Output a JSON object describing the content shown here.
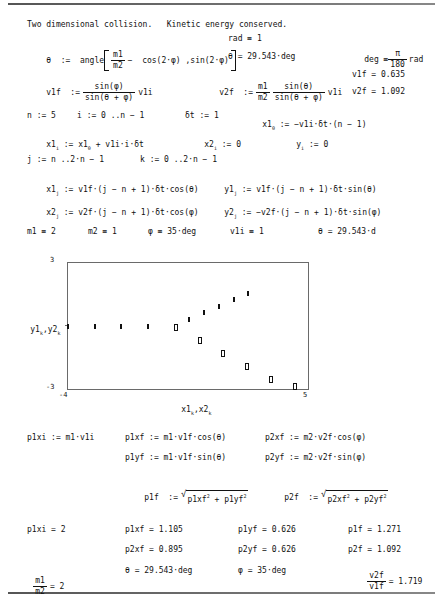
{
  "document": {
    "title_line": "Two dimensional collision.   Kinetic energy conserved.",
    "theta_def_label": "θ  :=  angle",
    "theta_def_m1": "m1",
    "theta_def_m2": "m2",
    "theta_def_rest": "−  cos(2·φ) ,sin(2·φ)",
    "rad_def": "rad ≡ 1",
    "theta_value": "θ = 29.543·deg",
    "deg_def_label": "deg ≡",
    "deg_def_num": "π",
    "deg_def_den": "180",
    "deg_def_unit": "rad",
    "v1f_label": "v1f  :=",
    "v1f_num": "sin(φ)",
    "v1f_den": "sin(θ + φ)",
    "v1f_tail": "v1i",
    "v2f_label": "v2f  :=",
    "v2f_f1_num": "m1",
    "v2f_f1_den": "m2",
    "v2f_f2_num": "sin(θ)",
    "v2f_f2_den": "sin(θ + φ)",
    "v2f_tail": "v1i",
    "v1f_value": "v1f = 0.635",
    "v2f_value": "v2f = 1.092",
    "n_def": "n := 5",
    "i_def": "i := 0 ..n − 1",
    "dt_def": "δt := 1",
    "x1_0_def_head": "x1",
    "x1_0_def_sub": "0",
    "x1_0_def_body": ":= −v1i·δt·(n − 1)",
    "x1_i_head": "x1",
    "x1_i_sub": "i",
    "x1_i_body_a": ":= x1",
    "x1_i_body_sub": "0",
    "x1_i_body_b": "+ v1i·i·δt",
    "x2_i_head": "x2",
    "x2_i_sub": "i",
    "x2_i_body": ":= 0",
    "y_i_head": "y",
    "y_i_sub": "i",
    "y_i_body": ":= 0",
    "j_def": "j := n ..2·n − 1",
    "k_def": "k := 0 ..2·n − 1",
    "x1_j_head": "x1",
    "x1_j_sub": "j",
    "x1_j_body": ":= v1f·(j − n + 1)·δt·cos(θ)",
    "y1_j_head": "y1",
    "y1_j_sub": "j",
    "y1_j_body": ":= v1f·(j − n + 1)·δt·sin(θ)",
    "x2_j_head": "x2",
    "x2_j_sub": "j",
    "x2_j_body": ":= v2f·(j − n + 1)·δt·cos(φ)",
    "y2_j_head": "y2",
    "y2_j_sub": "j",
    "y2_j_body": ":= −v2f·(j − n + 1)·δt·sin(φ)",
    "m1_val": "m1 ≡ 2",
    "m2_val": "m2 ≡ 1",
    "phi_val": "φ ≡ 35·deg",
    "v1i_val": "v1i ≡ 1",
    "theta_val_trunc": "θ = 29.543·d",
    "p1xi_def": "p1xi := m1·v1i",
    "p1xf_def": "p1xf := m1·v1f·cos(θ)",
    "p1yf_def": "p1yf := m1·v1f·sin(θ)",
    "p2xf_def": "p2xf := m2·v2f·cos(φ)",
    "p2yf_def": "p2yf := m2·v2f·sin(φ)",
    "p1f_label": "p1f  :=",
    "p1f_rad_a": "p1xf",
    "p1f_rad_b": "+ p1yf",
    "p2f_label": "p2f  :=",
    "p2f_rad_a": "p2xf",
    "p2f_rad_b": "+ p2yf",
    "sq": "2",
    "p1xi_value": "p1xi = 2",
    "p1xf_value": "p1xf = 1.105",
    "p1yf_value": "p1yf = 0.626",
    "p1f_value": "p1f = 1.271",
    "p2xf_value": "p2xf = 0.895",
    "p2yf_value": "p2yf = 0.626",
    "p2f_value": "p2f = 1.092",
    "ratio_m_num": "m1",
    "ratio_m_den": "m2",
    "ratio_m_value": "= 2",
    "theta_final": "θ = 29.543·deg",
    "phi_final": "φ = 35·deg",
    "ratio_v_num": "v2f",
    "ratio_v_den": "v1f",
    "ratio_v_value": "= 1.719"
  },
  "chart_data": {
    "type": "scatter",
    "title": "",
    "xlabel_parts": {
      "a": "x1",
      "a_sub": "k",
      "b": ",x2",
      "b_sub": "k"
    },
    "ylabel_parts": {
      "a": "y1",
      "a_sub": "k",
      "b": ",y2",
      "b_sub": "k"
    },
    "xlim": [
      -4,
      5
    ],
    "ylim": [
      -3,
      3
    ],
    "xticklabels": [
      "-4",
      "5"
    ],
    "yticklabels": [
      "3",
      "-3"
    ],
    "grid": false,
    "legend": false,
    "series": [
      {
        "name": "y1_k vs x1_k",
        "marker": "filled-diamond",
        "x": [
          -4,
          -3,
          -2,
          -1,
          0,
          0.552,
          1.104,
          1.656,
          2.208,
          2.76
        ],
        "y": [
          0,
          0,
          0,
          0,
          0,
          0.313,
          0.626,
          0.939,
          1.252,
          1.565
        ]
      },
      {
        "name": "y2_k vs x2_k",
        "marker": "open-square",
        "x": [
          0,
          0,
          0,
          0,
          0,
          0.895,
          1.789,
          2.684,
          3.578,
          4.473
        ],
        "y": [
          0,
          0,
          0,
          0,
          0,
          -0.626,
          -1.253,
          -1.879,
          -2.505,
          -3.132
        ]
      }
    ]
  }
}
